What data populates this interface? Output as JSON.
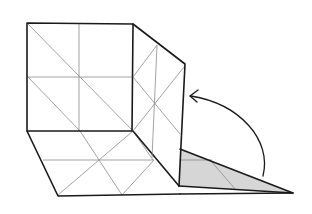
{
  "diagram": {
    "colors": {
      "outline": "#1a1a1a",
      "crease": "#8a8a8a",
      "shade": "#d6d6d6",
      "background": "#ffffff"
    },
    "arrow": {
      "direction": "fold-up",
      "from": [
        263,
        176
      ],
      "to": [
        191,
        96
      ]
    }
  }
}
